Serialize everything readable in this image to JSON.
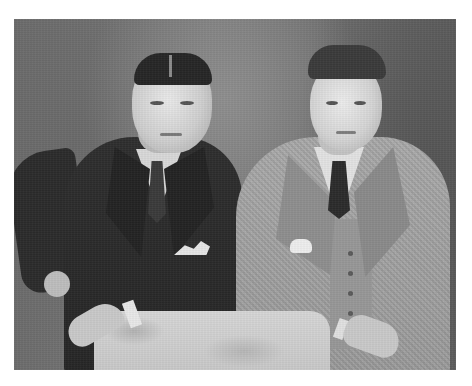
{
  "image": {
    "type": "black-and-white portrait photograph",
    "description": "Two men in suits posing beside a cloth-draped table against a mottled studio backdrop",
    "frame": {
      "x": 14,
      "y": 19,
      "width": 442,
      "height": 351
    },
    "border_color": "#ffffff",
    "backdrop_color": "#727272"
  },
  "subjects": [
    {
      "position": "left",
      "attire": "dark double-breasted suit with patterned tie and white pocket square",
      "pose": "hand on hip, forearm resting on table",
      "hair": "dark, center-parted, slicked",
      "suit_color": "#2a2a2a"
    },
    {
      "position": "right",
      "attire": "light tweed three-piece suit with dark tie and white pocket square",
      "pose": "arm resting on table, hand near waist",
      "hair": "dark, wavy",
      "suit_color": "#a0a0a0"
    }
  ],
  "props": [
    {
      "name": "table",
      "description": "small table draped in light mottled cloth",
      "color": "#cecece"
    }
  ]
}
